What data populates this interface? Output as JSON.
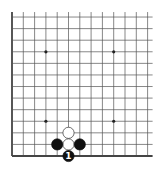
{
  "board": {
    "description": "Partial Go board (bottom-left area), 13 vertical x 13 horizontal lines visible",
    "edges": [
      "left",
      "bottom"
    ],
    "origin": {
      "x": 12,
      "y": 156
    },
    "spacing_x": 11.3,
    "spacing_y": 11.58,
    "columns": 13,
    "rows": 13,
    "line_color": "#555555",
    "edge_color": "#444444",
    "star_points": [
      {
        "col": 3,
        "row": 3
      },
      {
        "col": 9,
        "row": 3
      },
      {
        "col": 3,
        "row": 9
      },
      {
        "col": 9,
        "row": 9
      }
    ],
    "stones": [
      {
        "color": "white",
        "col": 5,
        "row": 2,
        "label": ""
      },
      {
        "color": "white",
        "col": 5,
        "row": 1,
        "label": ""
      },
      {
        "color": "black",
        "col": 4,
        "row": 1,
        "label": ""
      },
      {
        "color": "black",
        "col": 6,
        "row": 1,
        "label": ""
      },
      {
        "color": "black",
        "col": 5,
        "row": 0,
        "label": "1"
      }
    ],
    "colors": {
      "black_stone": "#111111",
      "white_stone": "#ffffff",
      "white_stone_border": "#333333",
      "black_label": "#ffffff",
      "white_label": "#000000"
    }
  }
}
